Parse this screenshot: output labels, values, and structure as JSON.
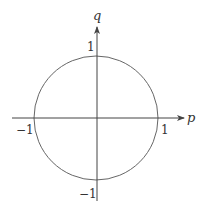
{
  "diagram": {
    "type": "unit-circle-phase-plane",
    "axes": {
      "horizontal": {
        "label": "p"
      },
      "vertical": {
        "label": "q"
      }
    },
    "ticks": {
      "p_pos": "1",
      "p_neg": "−1",
      "q_pos": "1",
      "q_neg": "−1"
    },
    "circle": {
      "center": [
        0,
        0
      ],
      "radius": 1
    },
    "colors": {
      "stroke": "#555555",
      "text": "#333333",
      "background": "#ffffff"
    }
  }
}
